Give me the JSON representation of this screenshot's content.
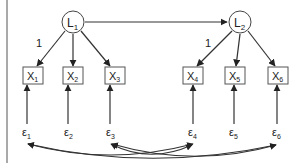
{
  "diagram": {
    "type": "path-diagram",
    "latents": [
      {
        "id": "L1",
        "label": "L",
        "sub": "1",
        "cx": 73,
        "cy": 22
      },
      {
        "id": "L2",
        "label": "L",
        "sub": "2",
        "cx": 240,
        "cy": 22
      }
    ],
    "indicators": [
      {
        "id": "X1",
        "label": "X",
        "sub": "1",
        "cx": 33,
        "cy": 75
      },
      {
        "id": "X2",
        "label": "X",
        "sub": "2",
        "cx": 73,
        "cy": 75
      },
      {
        "id": "X3",
        "label": "X",
        "sub": "3",
        "cx": 115,
        "cy": 75
      },
      {
        "id": "X4",
        "label": "X",
        "sub": "4",
        "cx": 193,
        "cy": 75
      },
      {
        "id": "X5",
        "label": "X",
        "sub": "5",
        "cx": 235,
        "cy": 75
      },
      {
        "id": "X6",
        "label": "X",
        "sub": "6",
        "cx": 278,
        "cy": 75
      }
    ],
    "errors": [
      {
        "id": "e1",
        "label": "ε",
        "sub": "1",
        "x": 27,
        "y": 136
      },
      {
        "id": "e2",
        "label": "ε",
        "sub": "2",
        "x": 68,
        "y": 136
      },
      {
        "id": "e3",
        "label": "ε",
        "sub": "3",
        "x": 110,
        "y": 136
      },
      {
        "id": "e4",
        "label": "ε",
        "sub": "4",
        "x": 192,
        "y": 136
      },
      {
        "id": "e5",
        "label": "ε",
        "sub": "5",
        "x": 233,
        "y": 136
      },
      {
        "id": "e6",
        "label": "ε",
        "sub": "6",
        "x": 276,
        "y": 136
      }
    ],
    "loading_labels": [
      {
        "text": "1",
        "x": 38,
        "y": 46
      },
      {
        "text": "1",
        "x": 207,
        "y": 46
      }
    ],
    "structural_path": {
      "from": "L1",
      "to": "L2"
    },
    "covariances": [
      [
        "e1",
        "e4"
      ],
      [
        "e1",
        "e6"
      ],
      [
        "e3",
        "e4"
      ],
      [
        "e3",
        "e6"
      ]
    ],
    "colors": {
      "stroke": "#333333",
      "node_fill": "#ffffff"
    }
  }
}
